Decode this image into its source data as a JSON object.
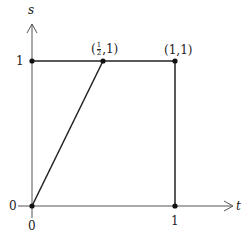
{
  "diagram": {
    "axes": {
      "x_label": "t",
      "y_label": "s",
      "x_ticks": [
        "0",
        "1"
      ],
      "y_ticks": [
        "0",
        "1"
      ]
    },
    "points": [
      {
        "id": "origin",
        "label": "",
        "t": 0,
        "s": 0
      },
      {
        "id": "half-one",
        "label_open": "(",
        "frac_num": "1",
        "frac_den": "2",
        "label_close": ",1)",
        "t": 0.5,
        "s": 1
      },
      {
        "id": "one-one",
        "label": "(1,1)",
        "t": 1,
        "s": 1
      },
      {
        "id": "zero-one",
        "label": "",
        "t": 0,
        "s": 1
      },
      {
        "id": "one-zero",
        "label": "",
        "t": 1,
        "s": 0
      }
    ],
    "colors": {
      "line": "#222222",
      "axis": "#555555"
    }
  }
}
